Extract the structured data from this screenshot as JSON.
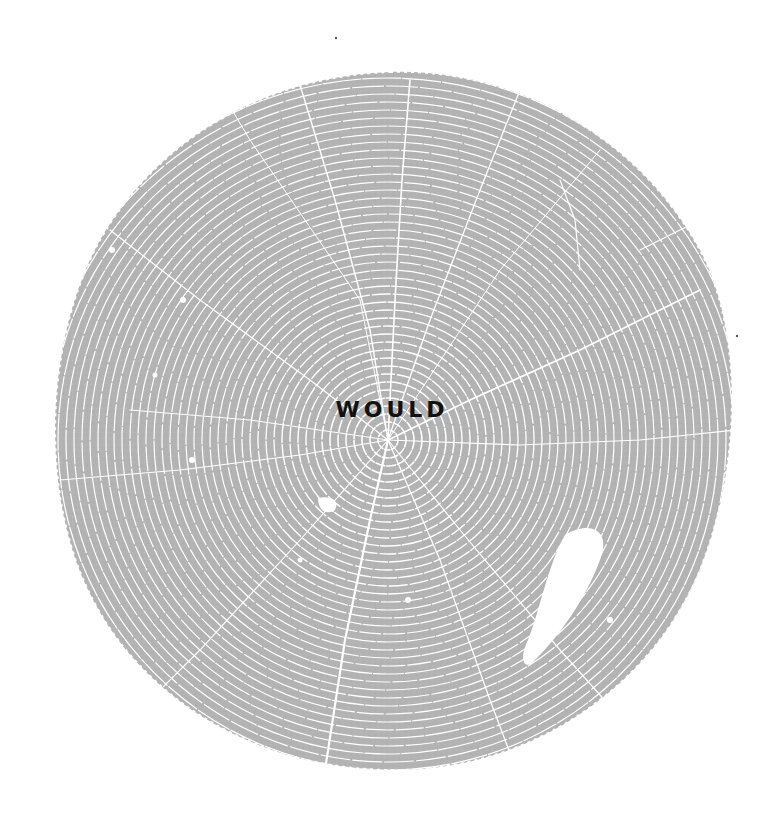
{
  "poster": {
    "title": "WOULD",
    "colors": {
      "background": "#ffffff",
      "wood": "#b3b3b3",
      "ring_gap": "#ffffff",
      "text": "#111111"
    }
  },
  "illustration": {
    "subject": "tree-stump-cross-section",
    "shape": "circle",
    "center": [
      390,
      416
    ],
    "radius": 343,
    "ring_center": [
      388,
      440
    ]
  }
}
